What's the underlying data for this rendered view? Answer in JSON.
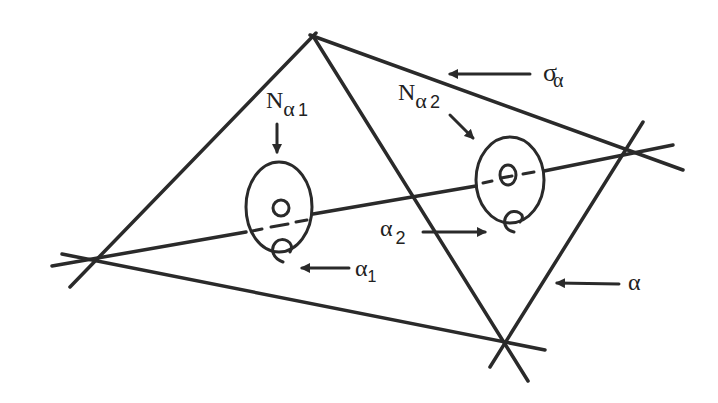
{
  "figure": {
    "stroke_color": "#2a2a2a",
    "background": "#ffffff",
    "labels": {
      "n_alpha1": {
        "main": "N",
        "greek": "α",
        "sub": "1"
      },
      "n_alpha2": {
        "main": "N",
        "greek": "α",
        "sub": "2"
      },
      "sigma_alpha": {
        "main": "σ",
        "greek_sub": "α"
      },
      "alpha1": {
        "greek": "α",
        "sub": "1"
      },
      "alpha2": {
        "greek": "α",
        "sub": "2"
      },
      "alpha": {
        "greek": "α"
      }
    },
    "lines": [
      {
        "name": "line-top-to-left",
        "x1": 316,
        "y1": 33,
        "x2": 70,
        "y2": 287
      },
      {
        "name": "line-top-to-right",
        "x1": 310,
        "y1": 35,
        "x2": 683,
        "y2": 170
      },
      {
        "name": "line-top-to-bottom",
        "x1": 313,
        "y1": 36,
        "x2": 528,
        "y2": 381
      },
      {
        "name": "line-left-to-bottom",
        "x1": 62,
        "y1": 254,
        "x2": 545,
        "y2": 350
      },
      {
        "name": "line-alpha-left-segment",
        "x1": 52,
        "y1": 266,
        "x2": 246,
        "y2": 232
      },
      {
        "name": "line-alpha-middle-segment",
        "x1": 313,
        "y1": 211,
        "x2": 476,
        "y2": 183
      },
      {
        "name": "line-alpha-right-segment",
        "x1": 544,
        "y1": 172,
        "x2": 673,
        "y2": 145
      },
      {
        "name": "line-alpha",
        "x1": 643,
        "y1": 122,
        "x2": 490,
        "y2": 367
      }
    ],
    "ellipses": [
      {
        "name": "neighborhood-n-alpha1",
        "cx": 279,
        "cy": 207,
        "rx": 34,
        "ry": 45
      },
      {
        "name": "neighborhood-n-alpha2",
        "cx": 510,
        "cy": 180,
        "rx": 34,
        "ry": 43
      }
    ]
  }
}
